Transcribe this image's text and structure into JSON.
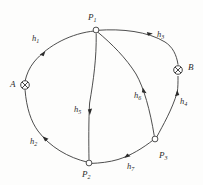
{
  "figure": {
    "background_color": "#fdfdfc",
    "stroke_color": "#3a3a3a",
    "nodes": [
      {
        "id": "P1",
        "label": "P",
        "sub": "1",
        "type": "open-circle",
        "x": 96,
        "y": 30,
        "label_x": 88,
        "label_y": 13
      },
      {
        "id": "P2",
        "label": "P",
        "sub": "2",
        "type": "open-circle",
        "x": 89,
        "y": 163,
        "label_x": 82,
        "label_y": 170
      },
      {
        "id": "P3",
        "label": "P",
        "sub": "3",
        "type": "open-circle",
        "x": 155,
        "y": 139,
        "label_x": 159,
        "label_y": 151
      },
      {
        "id": "A",
        "label": "A",
        "sub": "",
        "type": "crossed-circle",
        "x": 25,
        "y": 85,
        "label_x": 10,
        "label_y": 80
      },
      {
        "id": "B",
        "label": "B",
        "sub": "",
        "type": "crossed-circle",
        "x": 178,
        "y": 70,
        "label_x": 188,
        "label_y": 63
      }
    ],
    "edges": [
      {
        "id": "h1",
        "label": "h",
        "sub": "1",
        "from": "P1",
        "to": "A",
        "label_x": 32,
        "label_y": 34
      },
      {
        "id": "h2",
        "label": "h",
        "sub": "2",
        "from": "P2",
        "to": "A",
        "label_x": 30,
        "label_y": 137
      },
      {
        "id": "h3",
        "label": "h",
        "sub": "3",
        "from": "P1",
        "to": "B",
        "label_x": 157,
        "label_y": 30
      },
      {
        "id": "h4",
        "label": "h",
        "sub": "4",
        "from": "P3",
        "to": "B",
        "label_x": 180,
        "label_y": 97
      },
      {
        "id": "h5",
        "label": "h",
        "sub": "5",
        "from": "P1",
        "to": "P2",
        "label_x": 74,
        "label_y": 105
      },
      {
        "id": "h6",
        "label": "h",
        "sub": "6",
        "from": "P1",
        "to": "P3",
        "label_x": 134,
        "label_y": 91
      },
      {
        "id": "h7",
        "label": "h",
        "sub": "7",
        "from": "P3",
        "to": "P2",
        "label_x": 127,
        "label_y": 162
      }
    ]
  }
}
